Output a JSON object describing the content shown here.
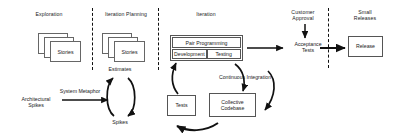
{
  "diagram": {
    "background": "#ffffff",
    "stroke_color": "#555555",
    "text_color": "#1a1a1a",
    "phases": [
      {
        "id": "exploration",
        "label": "Exploration"
      },
      {
        "id": "iteration-planning",
        "label": "Iteration Planning"
      },
      {
        "id": "iteration",
        "label": "Iteration"
      },
      {
        "id": "customer-approval",
        "label": "Customer\nApproval"
      },
      {
        "id": "small-releases",
        "label": "Small\nReleases"
      }
    ],
    "nodes": {
      "exploration_stories": "Stories",
      "planning_stories": "Stories",
      "architectural_spikes": "Architectural\nSpikes",
      "estimates": "Estimates",
      "spikes": "Spikes",
      "pair_programming": "Pair Programming",
      "development": "Development",
      "testing": "Testing",
      "tests": "Tests",
      "collective_codebase": "Collective\nCodebase",
      "acceptance_tests": "Acceptance\nTests",
      "release": "Release"
    },
    "edge_labels": {
      "system_metaphor": "System Metaphor",
      "continuous_integration": "Continuous Integration"
    },
    "separators": 3
  }
}
